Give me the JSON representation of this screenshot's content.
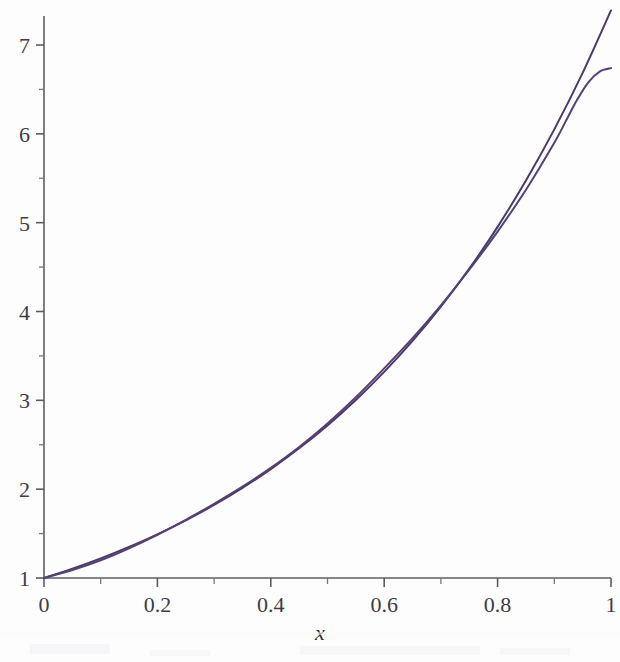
{
  "figure": {
    "background_color": "#fdfdfd",
    "axis_color": "#5c5c63",
    "label_color": "#3c3c46"
  },
  "chart_data": {
    "type": "line",
    "title": "",
    "subtitle": "",
    "xlabel": "x",
    "ylabel": "",
    "xlim": [
      0,
      1
    ],
    "ylim": [
      1,
      7.4
    ],
    "grid": false,
    "legend": "none",
    "x_ticks": [
      0,
      0.2,
      0.4,
      0.6,
      0.8,
      1
    ],
    "x_tick_labels": [
      "0",
      "0.2",
      "0.4",
      "0.6",
      "0.8",
      "1"
    ],
    "x_minor_ticks": [
      0.1,
      0.3,
      0.5,
      0.7,
      0.9
    ],
    "y_ticks": [
      1,
      2,
      3,
      4,
      5,
      6,
      7
    ],
    "y_tick_labels": [
      "1",
      "2",
      "3",
      "4",
      "5",
      "6",
      "7"
    ],
    "y_minor_ticks": [
      1.5,
      2.5,
      3.5,
      4.5,
      5.5,
      6.5
    ],
    "series": [
      {
        "name": "exponential",
        "color": "#4b3a69",
        "linewidth": 2.0,
        "x": [
          0,
          0.05,
          0.1,
          0.15,
          0.2,
          0.25,
          0.3,
          0.35,
          0.4,
          0.45,
          0.5,
          0.55,
          0.6,
          0.65,
          0.7,
          0.75,
          0.8,
          0.85,
          0.9,
          0.95,
          1
        ],
        "values": [
          1.0,
          1.105,
          1.221,
          1.35,
          1.492,
          1.649,
          1.822,
          2.014,
          2.226,
          2.46,
          2.718,
          3.004,
          3.32,
          3.669,
          4.055,
          4.482,
          4.953,
          5.474,
          6.05,
          6.686,
          7.389
        ]
      },
      {
        "name": "approximation",
        "color": "#534273",
        "linewidth": 2.0,
        "x": [
          0,
          0.05,
          0.1,
          0.15,
          0.2,
          0.25,
          0.3,
          0.35,
          0.4,
          0.45,
          0.5,
          0.55,
          0.6,
          0.65,
          0.7,
          0.75,
          0.8,
          0.85,
          0.9,
          0.92,
          0.94,
          0.96,
          0.98,
          1
        ],
        "values": [
          1.0,
          1.09,
          1.2,
          1.335,
          1.487,
          1.655,
          1.835,
          2.028,
          2.24,
          2.475,
          2.74,
          3.035,
          3.36,
          3.7,
          4.07,
          4.47,
          4.9,
          5.37,
          5.9,
          6.14,
          6.38,
          6.58,
          6.7,
          6.74
        ]
      }
    ]
  },
  "geometry": {
    "plot_left_px": 44,
    "plot_right_px": 611,
    "y_value_1_px": 578,
    "y_value_7_px": 45
  }
}
